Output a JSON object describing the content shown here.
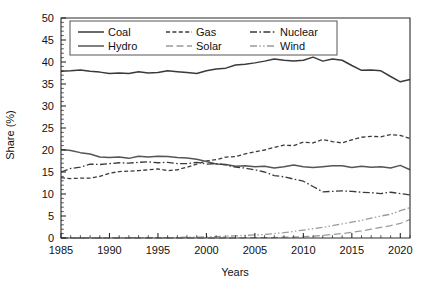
{
  "chart_data": {
    "type": "line",
    "title": "",
    "xlabel": "Years",
    "ylabel": "Share (%)",
    "xlim": [
      1985,
      2021
    ],
    "ylim": [
      0,
      50
    ],
    "ytick_step": 5,
    "xtick_step": 5,
    "xticks": [
      "1985",
      "1990",
      "1995",
      "2000",
      "2005",
      "2010",
      "2015",
      "2020"
    ],
    "xtick_values": [
      1985,
      1990,
      1995,
      2000,
      2005,
      2010,
      2015,
      2020
    ],
    "yticks": [
      "0",
      "5",
      "10",
      "15",
      "20",
      "25",
      "30",
      "35",
      "40",
      "45",
      "50"
    ],
    "ytick_values": [
      0,
      5,
      10,
      15,
      20,
      25,
      30,
      35,
      40,
      45,
      50
    ],
    "grid": false,
    "minor_ticks": true,
    "legend_position": "top-inside",
    "legend_columns": 3,
    "x": [
      1985,
      1986,
      1987,
      1988,
      1989,
      1990,
      1991,
      1992,
      1993,
      1994,
      1995,
      1996,
      1997,
      1998,
      1999,
      2000,
      2001,
      2002,
      2003,
      2004,
      2005,
      2006,
      2007,
      2008,
      2009,
      2010,
      2011,
      2012,
      2013,
      2014,
      2015,
      2016,
      2017,
      2018,
      2019,
      2020,
      2021
    ],
    "series": [
      {
        "name": "Coal",
        "color": "#3a3a3a",
        "dash": "solid",
        "values": [
          37.9,
          38.0,
          38.2,
          37.9,
          37.7,
          37.4,
          37.5,
          37.4,
          37.8,
          37.5,
          37.6,
          38.0,
          37.8,
          37.6,
          37.4,
          38.0,
          38.4,
          38.6,
          39.3,
          39.5,
          39.8,
          40.2,
          40.7,
          40.4,
          40.2,
          40.4,
          41.1,
          40.2,
          40.7,
          40.4,
          39.2,
          38.1,
          38.2,
          38.0,
          36.7,
          35.5,
          36.0
        ]
      },
      {
        "name": "Gas",
        "color": "#3a3a3a",
        "dash": "short-dash",
        "values": [
          13.7,
          13.5,
          13.6,
          13.6,
          14.0,
          14.7,
          15.1,
          15.2,
          15.3,
          15.5,
          15.7,
          15.3,
          15.5,
          16.1,
          16.8,
          17.5,
          17.8,
          18.4,
          18.5,
          19.1,
          19.6,
          20.0,
          20.6,
          21.1,
          21.0,
          21.8,
          21.6,
          22.4,
          21.9,
          21.6,
          22.3,
          22.9,
          23.1,
          23.0,
          23.5,
          23.3,
          22.6
        ]
      },
      {
        "name": "Hydro",
        "color": "#555555",
        "dash": "solid",
        "values": [
          20.1,
          19.9,
          19.4,
          19.1,
          18.4,
          18.3,
          18.4,
          18.1,
          18.6,
          18.4,
          18.6,
          18.5,
          18.3,
          18.2,
          17.9,
          17.4,
          16.8,
          16.7,
          16.3,
          16.4,
          16.2,
          16.3,
          15.9,
          16.2,
          16.6,
          16.2,
          16.0,
          16.2,
          16.4,
          16.4,
          16.0,
          16.3,
          16.1,
          16.2,
          15.9,
          16.5,
          15.5
        ]
      },
      {
        "name": "Nuclear",
        "color": "#3a3a3a",
        "dash": "dash-dot",
        "values": [
          15.0,
          15.8,
          16.1,
          16.8,
          16.7,
          16.9,
          17.1,
          17.0,
          17.2,
          17.3,
          17.1,
          17.2,
          16.9,
          16.9,
          17.2,
          16.8,
          16.9,
          16.6,
          16.1,
          15.9,
          15.5,
          15.0,
          14.2,
          13.9,
          13.4,
          12.9,
          11.7,
          10.5,
          10.6,
          10.7,
          10.6,
          10.4,
          10.3,
          10.1,
          10.4,
          10.1,
          9.8
        ]
      },
      {
        "name": "Solar",
        "color": "#9a9a9a",
        "dash": "long-dash",
        "values": [
          0.0,
          0.0,
          0.0,
          0.0,
          0.0,
          0.0,
          0.0,
          0.0,
          0.0,
          0.0,
          0.0,
          0.0,
          0.0,
          0.0,
          0.0,
          0.0,
          0.0,
          0.0,
          0.0,
          0.1,
          0.1,
          0.1,
          0.1,
          0.2,
          0.2,
          0.3,
          0.4,
          0.6,
          0.8,
          1.0,
          1.3,
          1.6,
          2.0,
          2.4,
          2.8,
          3.3,
          4.2
        ]
      },
      {
        "name": "Wind",
        "color": "#9a9a9a",
        "dash": "dash-dot-dot",
        "values": [
          0.0,
          0.0,
          0.0,
          0.0,
          0.0,
          0.0,
          0.1,
          0.1,
          0.1,
          0.1,
          0.1,
          0.1,
          0.1,
          0.2,
          0.2,
          0.3,
          0.3,
          0.4,
          0.5,
          0.6,
          0.7,
          0.8,
          1.0,
          1.2,
          1.5,
          1.8,
          2.1,
          2.4,
          2.8,
          3.2,
          3.6,
          4.0,
          4.5,
          5.0,
          5.4,
          6.2,
          6.9
        ]
      }
    ]
  },
  "legend": {
    "entries": [
      {
        "label": "Coal"
      },
      {
        "label": "Gas"
      },
      {
        "label": "Nuclear"
      },
      {
        "label": "Hydro"
      },
      {
        "label": "Solar"
      },
      {
        "label": "Wind"
      }
    ]
  }
}
